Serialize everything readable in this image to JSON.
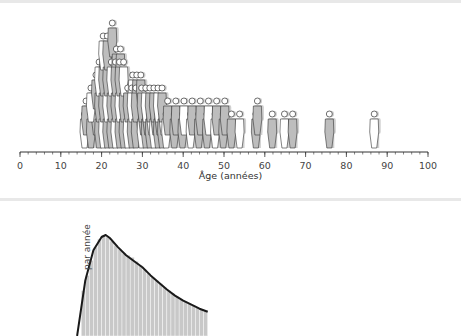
{
  "chart_data": [
    {
      "type": "scatter",
      "subtype": "pictograph",
      "title": "",
      "xlabel": "Âge (années)",
      "ylabel": "",
      "xlim": [
        0,
        100
      ],
      "xticks": [
        0,
        10,
        20,
        30,
        40,
        50,
        60,
        70,
        80,
        90,
        100
      ],
      "grid": false,
      "legend": null,
      "note": "Each person silhouette represents one individual placed at their age; figures stack where ages coincide. Counts are estimates from the full-size image.",
      "stacks": [
        {
          "age": 16,
          "count": 2
        },
        {
          "age": 18,
          "count": 4
        },
        {
          "age": 20,
          "count": 6
        },
        {
          "age": 21,
          "count": 7
        },
        {
          "age": 22,
          "count": 8
        },
        {
          "age": 23,
          "count": 6
        },
        {
          "age": 24,
          "count": 6
        },
        {
          "age": 25,
          "count": 5
        },
        {
          "age": 26,
          "count": 5
        },
        {
          "age": 27,
          "count": 4
        },
        {
          "age": 28,
          "count": 4
        },
        {
          "age": 29,
          "count": 4
        },
        {
          "age": 30,
          "count": 3
        },
        {
          "age": 31,
          "count": 3
        },
        {
          "age": 32,
          "count": 3
        },
        {
          "age": 33,
          "count": 3
        },
        {
          "age": 34,
          "count": 3
        },
        {
          "age": 35,
          "count": 3
        },
        {
          "age": 36,
          "count": 2
        },
        {
          "age": 38,
          "count": 2
        },
        {
          "age": 40,
          "count": 2
        },
        {
          "age": 42,
          "count": 2
        },
        {
          "age": 44,
          "count": 2
        },
        {
          "age": 46,
          "count": 2
        },
        {
          "age": 48,
          "count": 2
        },
        {
          "age": 50,
          "count": 2
        },
        {
          "age": 52,
          "count": 1
        },
        {
          "age": 54,
          "count": 1
        },
        {
          "age": 58,
          "count": 2
        },
        {
          "age": 62,
          "count": 1
        },
        {
          "age": 65,
          "count": 1
        },
        {
          "age": 67,
          "count": 1
        },
        {
          "age": 76,
          "count": 1
        },
        {
          "age": 87,
          "count": 1
        }
      ],
      "colors": {
        "figure_fill": "#bdbdbd",
        "figure_outline": "#333333",
        "axis": "#333333"
      }
    },
    {
      "type": "bar",
      "subtype": "histogram-with-density",
      "title": "",
      "xlabel": "",
      "ylabel": "… par année",
      "xlim": [
        0,
        100
      ],
      "grid": false,
      "legend": null,
      "note": "Histogram of ages (1-year bins) with smoothed density curve; the panel is cropped at the bottom of the screenshot. Values are relative heights estimated from the full-size image.",
      "bins": [
        15,
        16,
        17,
        18,
        19,
        20,
        21,
        22,
        23,
        24,
        25,
        26,
        27,
        28,
        29,
        30,
        31,
        32,
        33,
        34,
        35,
        36,
        37,
        38,
        39,
        40,
        41,
        42,
        43,
        44,
        45
      ],
      "values": [
        0.45,
        0.6,
        0.75,
        0.88,
        0.96,
        1.0,
        0.98,
        0.94,
        0.9,
        0.86,
        0.82,
        0.8,
        0.78,
        0.74,
        0.7,
        0.66,
        0.62,
        0.58,
        0.55,
        0.52,
        0.48,
        0.45,
        0.42,
        0.39,
        0.36,
        0.34,
        0.32,
        0.3,
        0.28,
        0.26,
        0.25
      ],
      "density_curve": {
        "x": [
          14,
          16,
          18,
          20,
          21,
          22,
          24,
          26,
          28,
          30,
          32,
          34,
          36,
          38,
          40,
          42,
          44,
          46
        ],
        "y": [
          0.0,
          0.55,
          0.85,
          0.98,
          1.0,
          0.97,
          0.88,
          0.8,
          0.74,
          0.68,
          0.6,
          0.53,
          0.46,
          0.4,
          0.35,
          0.31,
          0.27,
          0.24
        ]
      },
      "colors": {
        "bar_fill": "#c8c8c8",
        "bar_edge": "#ffffff",
        "curve": "#1a1a1a"
      }
    }
  ],
  "top_panel": {
    "axis_label": "Âge (années)",
    "tick_labels": [
      "0",
      "10",
      "20",
      "30",
      "40",
      "50",
      "60",
      "70",
      "80",
      "90",
      "100"
    ]
  },
  "bottom_panel": {
    "ylabel": "par année"
  }
}
